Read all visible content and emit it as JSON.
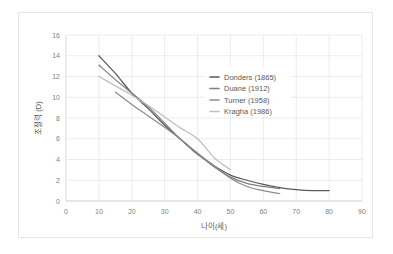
{
  "chart_data": {
    "type": "line",
    "title": "",
    "xlabel": "나이(세)",
    "ylabel": "조절력 (D)",
    "xlim": [
      0,
      90
    ],
    "ylim": [
      0,
      16
    ],
    "xticks": [
      0,
      10,
      20,
      30,
      40,
      50,
      60,
      70,
      80,
      90
    ],
    "yticks": [
      0,
      2,
      4,
      6,
      8,
      10,
      12,
      14,
      16
    ],
    "grid": true,
    "legend_position": "center-right",
    "series": [
      {
        "name": "Donders (1865)",
        "color": "#595959",
        "x": [
          10,
          15,
          20,
          25,
          30,
          35,
          40,
          45,
          50,
          55,
          60,
          65,
          70,
          75,
          80
        ],
        "y": [
          14.0,
          12.3,
          10.4,
          8.9,
          7.3,
          5.9,
          4.5,
          3.4,
          2.5,
          2.0,
          1.6,
          1.3,
          1.1,
          1.0,
          1.0
        ]
      },
      {
        "name": "Duane (1912)",
        "color": "#7f7f7f",
        "x": [
          10,
          15,
          20,
          25,
          30,
          35,
          40,
          45,
          50,
          55,
          60,
          65
        ],
        "y": [
          13.1,
          11.7,
          10.4,
          9.1,
          7.5,
          5.9,
          4.6,
          3.3,
          2.3,
          1.7,
          1.4,
          1.2
        ]
      },
      {
        "name": "Turner (1958)",
        "color": "#8c8c8c",
        "x": [
          15,
          20,
          25,
          30,
          35,
          40,
          45,
          50,
          55,
          60,
          65
        ],
        "y": [
          10.5,
          9.3,
          8.2,
          7.1,
          5.9,
          4.6,
          3.4,
          2.2,
          1.4,
          1.0,
          0.7
        ]
      },
      {
        "name": "Kragha (1986)",
        "color": "#bfbfbf",
        "x": [
          10,
          15,
          20,
          25,
          30,
          35,
          40,
          45,
          50
        ],
        "y": [
          12.0,
          11.1,
          10.2,
          9.2,
          8.1,
          7.0,
          6.0,
          4.2,
          3.0
        ]
      }
    ]
  },
  "legend": {
    "items": [
      {
        "label": "Donders (1865)",
        "color": "#595959"
      },
      {
        "label": "Duane (1912)",
        "color": "#7f7f7f"
      },
      {
        "label": "Turner (1958)",
        "color": "#8c8c8c"
      },
      {
        "label": "Kragha (1986)",
        "color": "#bfbfbf"
      }
    ]
  },
  "colors": {
    "grid": "#e4e4e4",
    "axis": "#d0d0d0",
    "tick_text": "#808080",
    "title_text": "#595959",
    "card_border": "#e6e6e6",
    "background": "#ffffff"
  }
}
